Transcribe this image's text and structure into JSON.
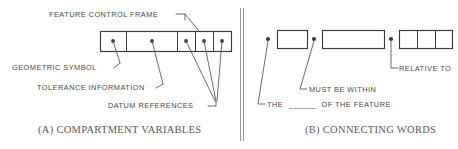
{
  "figure": {
    "background_color": "#ffffff",
    "ink_color": "#3a3a3a",
    "label_color": "#4a4a4a",
    "caption_color": "#5a5a5a",
    "divider_color": "#9a9a9a"
  },
  "panel_a": {
    "caption": "(A) COMPARTMENT VARIABLES",
    "title_label": "FEATURE CONTROL FRAME",
    "callouts": [
      {
        "id": "geometric-symbol",
        "label": "GEOMETRIC SYMBOL"
      },
      {
        "id": "tolerance-information",
        "label": "TOLERANCE INFORMATION"
      },
      {
        "id": "datum-references",
        "label": "DATUM REFERENCES"
      }
    ],
    "frame": {
      "compartment_count": 5,
      "compartments": [
        {
          "index": 1,
          "width_class": "small",
          "has_dot": true
        },
        {
          "index": 2,
          "width_class": "large",
          "has_dot": true
        },
        {
          "index": 3,
          "width_class": "small",
          "has_dot": true
        },
        {
          "index": 4,
          "width_class": "small",
          "has_dot": true
        },
        {
          "index": 5,
          "width_class": "small",
          "has_dot": true
        }
      ]
    }
  },
  "panel_b": {
    "caption": "(B) CONNECTING WORDS",
    "callouts": [
      {
        "id": "the-of-the-feature",
        "label_before": "THE",
        "blank": "______",
        "label_after": "OF THE FEATURE"
      },
      {
        "id": "must-be-within",
        "label": "MUST BE WITHIN"
      },
      {
        "id": "relative-to",
        "label": "RELATIVE TO"
      }
    ],
    "boxes": [
      {
        "index": 1,
        "width_class": "small",
        "cells": 1
      },
      {
        "index": 2,
        "width_class": "wide",
        "cells": 1
      },
      {
        "index": 3,
        "width_class": "triple",
        "cells": 3
      }
    ]
  }
}
